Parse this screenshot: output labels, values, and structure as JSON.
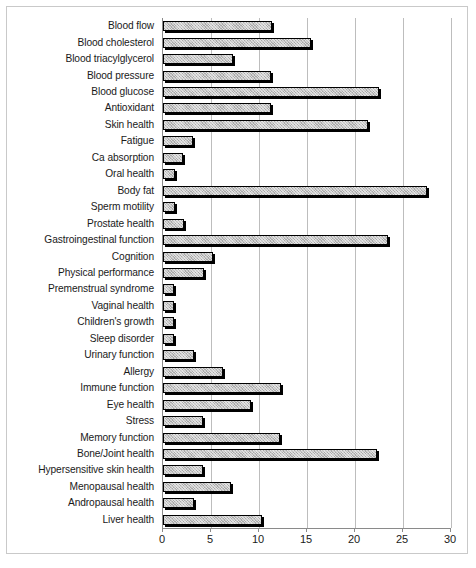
{
  "chart_data": {
    "type": "bar",
    "orientation": "horizontal",
    "title": "",
    "subtitle": "",
    "xlabel": "",
    "ylabel": "",
    "xlim": [
      0,
      30
    ],
    "ylim": null,
    "xticks": [
      0,
      5,
      10,
      15,
      20,
      25,
      30
    ],
    "xtick_labels": [
      "0",
      "5",
      "10",
      "15",
      "20",
      "25",
      "30"
    ],
    "grid": "vertical",
    "legend": null,
    "legend_position": "none",
    "annotations": [],
    "categories": [
      "Blood flow",
      "Blood cholesterol",
      "Blood triacylglycerol",
      "Blood pressure",
      "Blood glucose",
      "Antioxidant",
      "Skin health",
      "Fatigue",
      "Ca absorption",
      "Oral health",
      "Body fat",
      "Sperm motility",
      "Prostate health",
      "Gastroingestinal function",
      "Cognition",
      "Physical performance",
      "Premenstrual syndrome",
      "Vaginal health",
      "Children's growth",
      "Sleep disorder",
      "Urinary function",
      "Allergy",
      "Immune function",
      "Eye health",
      "Stress",
      "Memory function",
      "Bone/Joint health",
      "Hypersensitive skin health",
      "Menopausal health",
      "Andropausal health",
      "Liver health"
    ],
    "values": [
      11.4,
      15.4,
      7.3,
      11.3,
      22.5,
      11.3,
      21.4,
      3.1,
      2.1,
      1.3,
      27.5,
      1.2,
      2.2,
      23.4,
      5.2,
      4.3,
      1.1,
      1.1,
      1.1,
      1.1,
      3.2,
      6.2,
      12.3,
      9.2,
      4.2,
      12.2,
      22.3,
      4.2,
      7.1,
      3.2,
      10.3
    ],
    "colors": {
      "bar_fill": "#c4c4c4",
      "bar_edge": "#000000",
      "grid": "#bdbdbd",
      "axis": "#8a8a8a",
      "text": "#1a1a1a",
      "background": "#ffffff"
    }
  }
}
